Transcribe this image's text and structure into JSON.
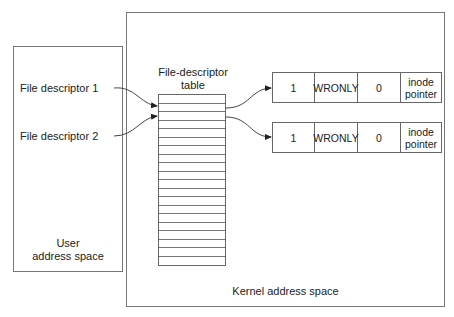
{
  "diagram": {
    "user_space": {
      "label_line1": "User",
      "label_line2": "address space"
    },
    "kernel_space": {
      "label": "Kernel address space"
    },
    "descriptors": [
      {
        "label": "File descriptor 1"
      },
      {
        "label": "File descriptor 2"
      }
    ],
    "fd_table": {
      "title_line1": "File-descriptor",
      "title_line2": "table",
      "row_count": 20
    },
    "open_file_entries": [
      {
        "cells": [
          "1",
          "WRONLY",
          "0",
          "inode pointer"
        ]
      },
      {
        "cells": [
          "1",
          "WRONLY",
          "0",
          "inode pointer"
        ]
      }
    ]
  }
}
